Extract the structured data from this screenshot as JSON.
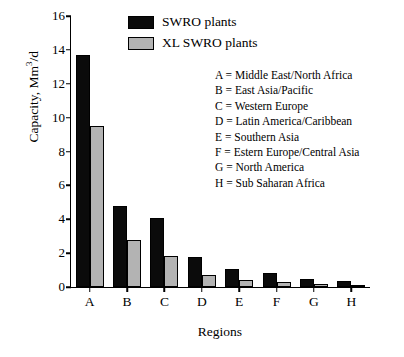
{
  "chart_data": {
    "type": "bar",
    "title": "",
    "xlabel": "Regions",
    "ylabel": "Capacity, Mm3/d",
    "ylabel_base": "Capacity, Mm",
    "ylabel_sup": "3",
    "ylabel_tail": "/d",
    "categories": [
      "A",
      "B",
      "C",
      "D",
      "E",
      "F",
      "G",
      "H"
    ],
    "series": [
      {
        "name": "SWRO plants",
        "color": "#0b0b0b",
        "values": [
          13.7,
          4.8,
          4.1,
          1.75,
          1.05,
          0.85,
          0.5,
          0.35
        ]
      },
      {
        "name": "XL SWRO plants",
        "color": "#b3b3b3",
        "values": [
          9.5,
          2.8,
          1.85,
          0.7,
          0.4,
          0.3,
          0.15,
          0.08
        ]
      }
    ],
    "ylim": [
      0,
      16
    ],
    "yticks": [
      0,
      2,
      4,
      6,
      8,
      10,
      12,
      14,
      16
    ],
    "ytick_labels": [
      "0",
      "2",
      "4",
      "6",
      "8",
      "10",
      "12",
      "14",
      "16"
    ],
    "grid": false,
    "legend_position": "top-center"
  },
  "legend": {
    "items": [
      {
        "label": "SWRO plants"
      },
      {
        "label": "XL SWRO plants"
      }
    ]
  },
  "annotations": {
    "lines": [
      "A = Middle East/North Africa",
      "B = East Asia/Pacific",
      "C = Western Europe",
      "D = Latin America/Caribbean",
      "E = Southern Asia",
      "F = Estern Europe/Central Asia",
      "G = North America",
      "H = Sub Saharan Africa"
    ]
  }
}
